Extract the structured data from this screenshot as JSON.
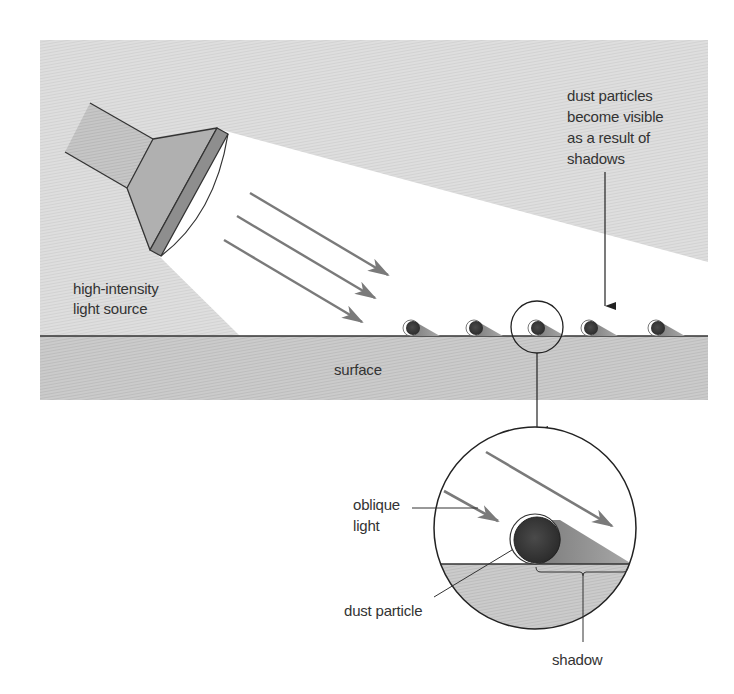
{
  "figure": {
    "labels": {
      "light_source": [
        "high-intensity",
        "light source"
      ],
      "dust_visible": [
        "dust particles",
        "become visible",
        "as a result of",
        "shadows"
      ],
      "surface": "surface",
      "oblique_light": [
        "oblique",
        "light"
      ],
      "dust_particle": "dust particle",
      "shadow": "shadow"
    },
    "particle_count": 5,
    "colors": {
      "background_gray": "#dcdcdc",
      "surface_gray": "#c8c8c8",
      "beam": "#ffffff",
      "flashlight_body": "#c4c4c4",
      "flashlight_head": "#aeaeae",
      "flashlight_rim": "#8a8a8a",
      "particle": "#3a3a3a",
      "shadow": "#8c8c8c",
      "arrow": "#7a7a7a",
      "line": "#333333"
    }
  }
}
